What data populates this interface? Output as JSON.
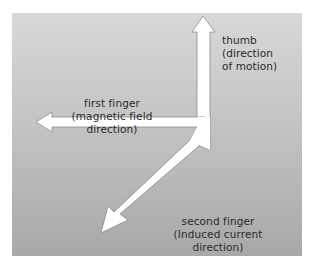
{
  "diagram": {
    "colors": {
      "panel_top": "#d8d8d8",
      "panel_bottom": "#a8a8a8",
      "arrow_fill": "#ffffff",
      "arrow_stroke": "#8a8a8a",
      "text": "#2a2a2a"
    },
    "labels": {
      "thumb": {
        "line1": "thumb",
        "line2": "(direction",
        "line3": "of motion)"
      },
      "first_finger": {
        "line1": "first finger",
        "line2": "(magnetic field",
        "line3": "direction)"
      },
      "second_finger": {
        "line1": "second finger",
        "line2": "(Induced current",
        "line3": "direction)"
      }
    },
    "arrows": [
      {
        "name": "thumb",
        "direction": "up"
      },
      {
        "name": "first-finger",
        "direction": "left"
      },
      {
        "name": "second-finger",
        "direction": "down-left"
      }
    ]
  }
}
